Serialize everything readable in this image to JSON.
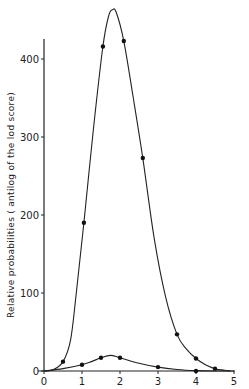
{
  "chart_data": {
    "type": "line",
    "title": "",
    "xlabel": "",
    "ylabel": "Relative probabilities ( antilog of the lod score)",
    "xlim": [
      0,
      5
    ],
    "ylim": [
      0,
      430
    ],
    "xticks": [
      0,
      1,
      2,
      3,
      4,
      5
    ],
    "yticks": [
      0,
      100,
      200,
      300,
      400
    ],
    "grid": false,
    "legend": null,
    "series": [
      {
        "name": "upper curve",
        "points": [
          {
            "x": 0.5,
            "y": 12
          },
          {
            "x": 1.05,
            "y": 190
          },
          {
            "x": 1.55,
            "y": 416
          },
          {
            "x": 2.1,
            "y": 423
          },
          {
            "x": 2.6,
            "y": 273
          },
          {
            "x": 3.5,
            "y": 47
          },
          {
            "x": 4.0,
            "y": 16
          },
          {
            "x": 4.5,
            "y": 3
          }
        ],
        "curve": [
          [
            0.0,
            0
          ],
          [
            0.25,
            2
          ],
          [
            0.5,
            12
          ],
          [
            0.7,
            40
          ],
          [
            0.85,
            100
          ],
          [
            1.05,
            190
          ],
          [
            1.3,
            310
          ],
          [
            1.55,
            416
          ],
          [
            1.7,
            455
          ],
          [
            1.8,
            463
          ],
          [
            1.9,
            460
          ],
          [
            2.1,
            423
          ],
          [
            2.35,
            350
          ],
          [
            2.6,
            273
          ],
          [
            2.9,
            170
          ],
          [
            3.2,
            95
          ],
          [
            3.5,
            47
          ],
          [
            3.75,
            28
          ],
          [
            4.0,
            16
          ],
          [
            4.25,
            8
          ],
          [
            4.5,
            3
          ],
          [
            4.75,
            1
          ],
          [
            4.9,
            0
          ]
        ]
      },
      {
        "name": "lower curve",
        "points": [
          {
            "x": 1.0,
            "y": 8
          },
          {
            "x": 1.5,
            "y": 17
          },
          {
            "x": 2.0,
            "y": 17
          },
          {
            "x": 3.0,
            "y": 5
          },
          {
            "x": 4.0,
            "y": 0
          }
        ],
        "curve": [
          [
            0.0,
            0
          ],
          [
            0.5,
            3
          ],
          [
            1.0,
            8
          ],
          [
            1.25,
            12
          ],
          [
            1.5,
            17
          ],
          [
            1.75,
            20
          ],
          [
            2.0,
            17
          ],
          [
            2.5,
            10
          ],
          [
            3.0,
            5
          ],
          [
            3.5,
            2
          ],
          [
            4.0,
            0.5
          ],
          [
            4.5,
            0
          ],
          [
            5.0,
            0
          ]
        ]
      }
    ]
  },
  "labels": {
    "ylabel": "Relative probabilities ( antilog of the lod score)",
    "xticks": [
      "0",
      "1",
      "2",
      "3",
      "4",
      "5"
    ],
    "yticks": [
      "0",
      "100",
      "200",
      "300",
      "400"
    ]
  }
}
